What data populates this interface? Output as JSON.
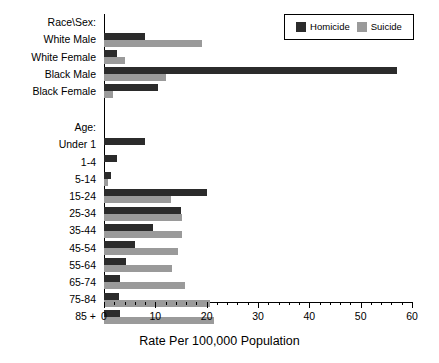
{
  "chart_data": {
    "type": "bar",
    "orientation": "horizontal",
    "title": "",
    "xlabel": "Rate Per 100,000 Population",
    "ylabel": "",
    "xlim": [
      0,
      60
    ],
    "xticks": [
      0,
      10,
      20,
      30,
      40,
      50,
      60
    ],
    "xtick_labels": [
      "0",
      "10",
      "20",
      "30",
      "40",
      "50",
      "60"
    ],
    "minor_tick_step": 2,
    "grid": false,
    "legend_position": "top-right",
    "series": [
      {
        "name": "Homicide",
        "color": "#2b2b2b"
      },
      {
        "name": "Suicide",
        "color": "#9a9a9a"
      }
    ],
    "groups": [
      {
        "header": "Race\\Sex:",
        "categories": [
          "White Male",
          "White Female",
          "Black Male",
          "Black Female"
        ],
        "homicide": [
          8.0,
          2.5,
          57.0,
          10.5
        ],
        "suicide": [
          19.0,
          4.0,
          12.0,
          1.8
        ]
      },
      {
        "header": "Age:",
        "categories": [
          "Under 1",
          "1-4",
          "5-14",
          "15-24",
          "25-34",
          "35-44",
          "45-54",
          "55-64",
          "65-74",
          "75-84",
          "85 +"
        ],
        "homicide": [
          8.0,
          2.6,
          1.3,
          20.0,
          15.0,
          9.5,
          6.0,
          4.3,
          3.2,
          3.0,
          3.2
        ],
        "suicide": [
          0.0,
          0.0,
          0.7,
          13.0,
          15.2,
          15.2,
          14.5,
          13.3,
          15.7,
          20.7,
          21.5
        ]
      }
    ]
  },
  "legend": {
    "items": [
      {
        "label": "Homicide",
        "color": "#2b2b2b"
      },
      {
        "label": "Suicide",
        "color": "#9a9a9a"
      }
    ]
  },
  "axis": {
    "x_title": "Rate Per 100,000 Population",
    "tick_labels": [
      "0",
      "10",
      "20",
      "30",
      "40",
      "50",
      "60"
    ]
  },
  "labels": {
    "race_header": "Race\\Sex:",
    "age_header": "Age:",
    "race_categories": [
      "White Male",
      "White Female",
      "Black Male",
      "Black Female"
    ],
    "age_categories": [
      "Under 1",
      "1-4",
      "5-14",
      "15-24",
      "25-34",
      "35-44",
      "45-54",
      "55-64",
      "65-74",
      "75-84",
      "85 +"
    ]
  },
  "colors": {
    "homicide": "#2b2b2b",
    "suicide": "#9a9a9a",
    "axis": "#000000",
    "background": "#ffffff"
  }
}
